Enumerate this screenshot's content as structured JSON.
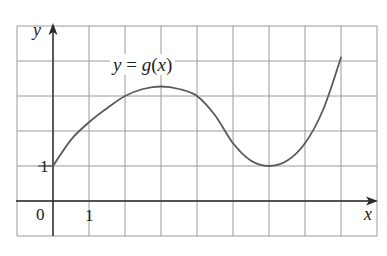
{
  "chart_data": {
    "type": "line",
    "title": "",
    "xlabel": "x",
    "ylabel": "y",
    "xlim": [
      -1,
      9
    ],
    "ylim": [
      -1,
      5
    ],
    "grid": true,
    "grid_step": 1,
    "tick_labels": {
      "origin": "0",
      "x": [
        "1"
      ],
      "y": [
        "1"
      ]
    },
    "series": [
      {
        "name": "y = g(x)",
        "x": [
          0,
          0.5,
          1,
          1.5,
          2,
          2.5,
          3,
          3.5,
          4,
          4.5,
          5,
          5.5,
          6,
          6.5,
          7,
          7.5,
          8
        ],
        "values": [
          1,
          1.75,
          2.25,
          2.65,
          3.0,
          3.2,
          3.27,
          3.2,
          3.0,
          2.45,
          1.65,
          1.15,
          1.0,
          1.15,
          1.65,
          2.6,
          4.1
        ]
      }
    ],
    "annotations": [
      {
        "text": "y = g(x)",
        "x": 2.6,
        "y": 3.85
      }
    ],
    "features": {
      "start_point": [
        0,
        1
      ],
      "local_max": [
        3,
        3.27
      ],
      "local_min": [
        6,
        1
      ],
      "end_point": [
        8,
        4.1
      ]
    }
  },
  "labels": {
    "curve": "y = g(x)",
    "curve_y": "y",
    "curve_eq": " = ",
    "curve_g": "g",
    "curve_paren_open": "(",
    "curve_x": "x",
    "curve_paren_close": ")",
    "y_axis": "y",
    "x_axis": "x",
    "origin": "0",
    "x_tick_1": "1",
    "y_tick_1": "1"
  },
  "colors": {
    "grid": "#9a9a9a",
    "axis": "#2a2a2a",
    "curve": "#5a5a5a",
    "background": "#ffffff"
  }
}
